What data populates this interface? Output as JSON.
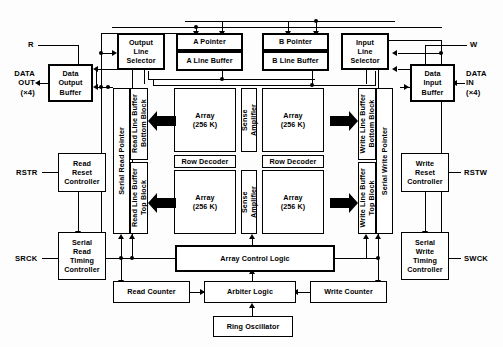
{
  "diagram": {
    "pins": {
      "r": "R",
      "w": "W",
      "data_out": "DATA\nOUT\n(×4)",
      "data_in": "DATA\nIN\n(×4)",
      "rstr": "RSTR",
      "rstw": "RSTW",
      "srck": "SRCK",
      "swck": "SWCK"
    },
    "blocks": {
      "output_line_selector": "Output\nLine\nSelector",
      "input_line_selector": "Input\nLine\nSelector",
      "a_pointer": "A Pointer",
      "a_line_buffer": "A Line Buffer",
      "b_pointer": "B Pointer",
      "b_line_buffer": "B Line Buffer",
      "data_output_buffer": "Data\nOutput\nBuffer",
      "data_input_buffer": "Data\nInput\nBuffer",
      "serial_read_pointer": "Serial Read Pointer",
      "serial_write_pointer": "Serial Write Pointer",
      "read_line_buffer_bottom": "Read Line Buffer\nBottom Block",
      "read_line_buffer_top": "Read Line Buffer\nTop Block",
      "write_line_buffer_bottom": "Write Line Buffer\nBottom Block",
      "write_line_buffer_top": "Write Line Buffer\nTop Block",
      "array_tl": "Array\n(256 K)",
      "array_tr": "Array\n(256 K)",
      "array_bl": "Array\n(256 K)",
      "array_br": "Array\n(256 K)",
      "sense_amplifier_top": "Sense\nAmplifier",
      "sense_amplifier_bottom": "Sense\nAmplifier",
      "row_decoder_left": "Row Decoder",
      "row_decoder_right": "Row Decoder",
      "read_reset_controller": "Read\nReset\nController",
      "write_reset_controller": "Write\nReset\nController",
      "serial_read_timing_controller": "Serial\nRead\nTiming\nController",
      "serial_write_timing_controller": "Serial\nWrite\nTiming\nController",
      "array_control_logic": "Array Control Logic",
      "read_counter": "Read Counter",
      "arbiter_logic": "Arbiter Logic",
      "write_counter": "Write Counter",
      "ring_oscillator": "Ring Oscillator"
    },
    "colors": {
      "line": "#000000",
      "box_fill": "#ffffff",
      "background": "#fdfdfd"
    }
  }
}
